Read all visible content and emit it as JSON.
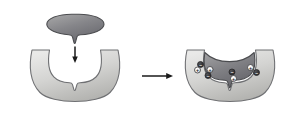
{
  "figure": {
    "background_color": "#ffffff",
    "width": 303,
    "height": 119
  },
  "palette": {
    "enzyme_fill_light": "#e3e3e2",
    "enzyme_fill_mid": "#c8c8c6",
    "enzyme_fill_dark": "#a9a9a7",
    "enzyme_outline": "#6f7073",
    "substrate_fill_light": "#9b9b9c",
    "substrate_fill_mid": "#7e7e80",
    "substrate_fill_dark": "#636366",
    "substrate_outline": "#4b4c4f",
    "arrow_color": "#1a1a1a",
    "charge_positive_fill": "#f0f0ef",
    "charge_negative_fill": "#2e2e30"
  },
  "panels": {
    "left": {
      "name": "unbound",
      "substrate": {
        "label": "substrate",
        "description": "teardrop body with downward pointing tip"
      },
      "enzyme": {
        "label": "enzyme",
        "description": "crescent body with notched active-site cleft"
      },
      "binding_arrow": {
        "label": "binding-direction",
        "direction": "down"
      }
    },
    "transition_arrow": {
      "label": "reaction-arrow",
      "direction": "right"
    },
    "right": {
      "name": "bound-complex",
      "enzyme": {
        "label": "enzyme"
      },
      "substrate": {
        "label": "substrate bound in active site"
      },
      "charges": [
        {
          "id": "c1",
          "sign": "-",
          "glyph": "−",
          "type": "negative",
          "cx": 200.5,
          "cy": 64.5,
          "r": 3.0,
          "side": "substrate"
        },
        {
          "id": "c2",
          "sign": "+",
          "glyph": "+",
          "type": "positive",
          "cx": 197.5,
          "cy": 70.0,
          "r": 3.0,
          "side": "enzyme"
        },
        {
          "id": "c3",
          "sign": "+",
          "glyph": "+",
          "type": "positive",
          "cx": 210.0,
          "cy": 69.5,
          "r": 3.0,
          "side": "enzyme"
        },
        {
          "id": "c4",
          "sign": "-",
          "glyph": "−",
          "type": "negative",
          "cx": 208.0,
          "cy": 75.5,
          "r": 3.0,
          "side": "substrate"
        },
        {
          "id": "c5",
          "sign": "-",
          "glyph": "−",
          "type": "negative",
          "cx": 232.0,
          "cy": 72.0,
          "r": 3.0,
          "side": "substrate"
        },
        {
          "id": "c6",
          "sign": "+",
          "glyph": "+",
          "type": "positive",
          "cx": 233.5,
          "cy": 78.5,
          "r": 3.0,
          "side": "enzyme"
        },
        {
          "id": "c7",
          "sign": "+",
          "glyph": "+",
          "type": "positive",
          "cx": 250.5,
          "cy": 67.5,
          "r": 3.0,
          "side": "enzyme"
        },
        {
          "id": "c8",
          "sign": "-",
          "glyph": "−",
          "type": "negative",
          "cx": 256.5,
          "cy": 72.5,
          "r": 3.0,
          "side": "substrate"
        }
      ]
    }
  }
}
